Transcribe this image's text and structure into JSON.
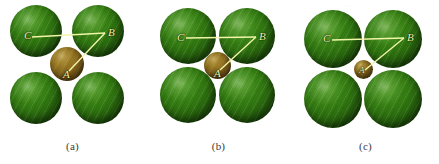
{
  "figure": {
    "background_color": "#ffffff",
    "anion_color": "#2f7410",
    "cation_color": "#85661b",
    "annotation_color": "#f2f5a8",
    "caption_color": "#3a3a3a",
    "top_artifact_text": "..."
  },
  "panels": [
    {
      "id": "panel-a",
      "caption": "(a)",
      "vertex_labels": {
        "a": "A",
        "b": "B",
        "c": "C"
      },
      "large_sphere_radius_px": 26,
      "small_sphere_radius_px": 17,
      "description": "Four large anions separated, large interstitial cation"
    },
    {
      "id": "panel-b",
      "caption": "(b)",
      "vertex_labels": {
        "a": "A",
        "b": "B",
        "c": "C"
      },
      "large_sphere_radius_px": 28,
      "small_sphere_radius_px": 13,
      "description": "Four large anions in contact, cation exactly fits hole"
    },
    {
      "id": "panel-c",
      "caption": "(c)",
      "vertex_labels": {
        "a": "A",
        "b": "B",
        "c": "C"
      },
      "large_sphere_radius_px": 29,
      "small_sphere_radius_px": 9,
      "description": "Four large anions in contact, cation too small for hole"
    }
  ]
}
